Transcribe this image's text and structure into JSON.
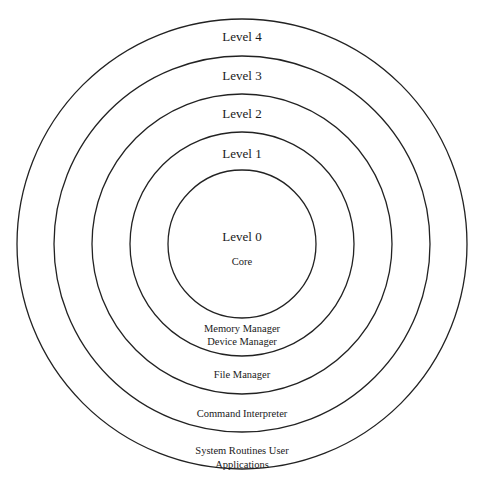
{
  "diagram": {
    "type": "concentric-layers",
    "center": {
      "x": 242,
      "y": 244
    },
    "colors": {
      "stroke": "#222222",
      "text": "#1a1a1a",
      "background": "#ffffff"
    },
    "rings": [
      {
        "level": "Level 0",
        "radius": 74
      },
      {
        "level": "Level 1",
        "radius": 112
      },
      {
        "level": "Level 2",
        "radius": 150
      },
      {
        "level": "Level 3",
        "radius": 188
      },
      {
        "level": "Level 4",
        "radius": 225
      }
    ],
    "level_labels": {
      "level4": "Level 4",
      "level3": "Level 3",
      "level2": "Level 2",
      "level1": "Level 1",
      "level0": "Level 0"
    },
    "components": {
      "core": "Core",
      "memory_manager": "Memory Manager",
      "device_manager": "Device Manager",
      "file_manager": "File Manager",
      "command_interpreter": "Command Interpreter",
      "system_routines_line1": "System Routines User",
      "system_routines_line2": "Applications"
    }
  }
}
